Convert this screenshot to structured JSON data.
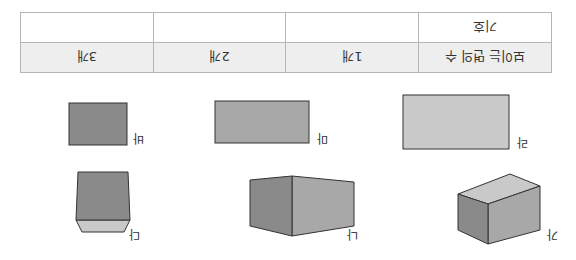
{
  "orientation": "rotated-180",
  "table": {
    "row_faces": {
      "header": "보이는 면의 수",
      "cells": [
        "1개",
        "2개",
        "3개"
      ]
    },
    "row_symbol": {
      "header": "기호",
      "cells": [
        "",
        "",
        ""
      ]
    }
  },
  "shapes": [
    {
      "label": "가",
      "faces_visible": 3
    },
    {
      "label": "나",
      "faces_visible": 2
    },
    {
      "label": "다",
      "faces_visible": 2
    },
    {
      "label": "라",
      "faces_visible": 1
    },
    {
      "label": "마",
      "faces_visible": 1
    },
    {
      "label": "바",
      "faces_visible": 1
    }
  ],
  "colors": {
    "light_face": "#c9c9c9",
    "mid_face": "#a8a8a8",
    "dark_face": "#8a8a8a",
    "edge": "#333333",
    "table_header_bg": "#eeeeee",
    "table_border": "#b5b5b5"
  }
}
